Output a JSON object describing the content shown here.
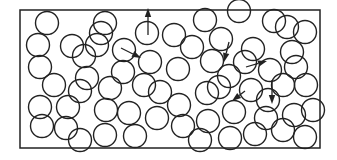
{
  "diagram": {
    "title": "",
    "colors": {
      "stroke": "#222222",
      "background": "#ffffff"
    },
    "container": {
      "x": 20,
      "y": 10,
      "width": 300,
      "height": 138
    },
    "particle_radius": 11.5,
    "particles": [
      [
        47,
        23
      ],
      [
        105,
        23
      ],
      [
        97,
        45
      ],
      [
        72,
        46
      ],
      [
        38,
        45
      ],
      [
        40,
        67
      ],
      [
        84,
        56
      ],
      [
        87,
        78
      ],
      [
        101,
        33
      ],
      [
        124,
        50
      ],
      [
        147,
        33
      ],
      [
        174,
        35
      ],
      [
        205,
        20
      ],
      [
        192,
        47
      ],
      [
        150,
        62
      ],
      [
        123,
        72
      ],
      [
        178,
        69
      ],
      [
        144,
        85
      ],
      [
        110,
        88
      ],
      [
        80,
        91
      ],
      [
        54,
        85
      ],
      [
        40,
        107
      ],
      [
        68,
        107
      ],
      [
        42,
        126
      ],
      [
        66,
        128
      ],
      [
        106,
        110
      ],
      [
        129,
        113
      ],
      [
        157,
        118
      ],
      [
        179,
        105
      ],
      [
        207,
        93
      ],
      [
        229,
        76
      ],
      [
        253,
        49
      ],
      [
        274,
        21
      ],
      [
        239,
        11
      ],
      [
        221,
        39
      ],
      [
        245,
        62
      ],
      [
        292,
        52
      ],
      [
        287,
        27
      ],
      [
        305,
        32
      ],
      [
        183,
        126
      ],
      [
        208,
        121
      ],
      [
        234,
        112
      ],
      [
        200,
        140
      ],
      [
        230,
        138
      ],
      [
        255,
        134
      ],
      [
        268,
        100
      ],
      [
        251,
        90
      ],
      [
        283,
        85
      ],
      [
        296,
        67
      ],
      [
        306,
        85
      ],
      [
        294,
        115
      ],
      [
        313,
        110
      ],
      [
        283,
        130
      ],
      [
        305,
        137
      ],
      [
        212,
        61
      ],
      [
        160,
        92
      ],
      [
        135,
        136
      ],
      [
        105,
        135
      ],
      [
        80,
        140
      ],
      [
        266,
        118
      ],
      [
        219,
        87
      ],
      [
        270,
        70
      ]
    ],
    "arrows": [
      {
        "from": [
          148,
          35
        ],
        "to": [
          148,
          8
        ]
      },
      {
        "from": [
          121,
          48
        ],
        "to": [
          141,
          58
        ]
      },
      {
        "from": [
          229,
          42
        ],
        "to": [
          224,
          62
        ]
      },
      {
        "from": [
          246,
          67
        ],
        "to": [
          267,
          61
        ]
      },
      {
        "from": [
          245,
          91
        ],
        "to": [
          232,
          101
        ]
      },
      {
        "from": [
          272,
          80
        ],
        "to": [
          272,
          104
        ]
      }
    ]
  }
}
